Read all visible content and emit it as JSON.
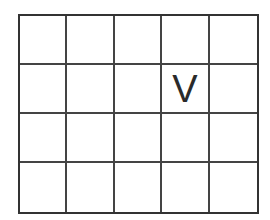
{
  "grid": {
    "rows": 4,
    "cols": 5,
    "border_color": "#333333",
    "cells": [
      [
        "",
        "",
        "",
        "",
        ""
      ],
      [
        "",
        "",
        "",
        "V",
        ""
      ],
      [
        "",
        "",
        "",
        "",
        ""
      ],
      [
        "",
        "",
        "",
        "",
        ""
      ]
    ]
  }
}
